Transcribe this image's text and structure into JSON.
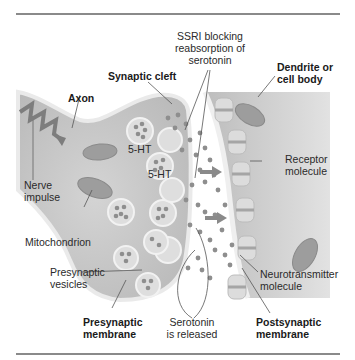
{
  "figure": {
    "labels": {
      "synaptic_cleft": "Synaptic cleft",
      "ssri": "SSRI blocking reabsorption of serotonin",
      "ssri_lines": [
        "SSRI blocking",
        "reabsorption of",
        "serotonin"
      ],
      "dendrite_lines": [
        "Dendrite or",
        "cell body"
      ],
      "axon": "Axon",
      "nerve_impulse_lines": [
        "Nerve",
        "impulse"
      ],
      "ht1": "5-HT",
      "ht2": "5-HT",
      "receptor_lines": [
        "Receptor",
        "molecule"
      ],
      "mitochondrion": "Mitochondrion",
      "presynaptic_vesicles_lines": [
        "Presynaptic",
        "vesicles"
      ],
      "neurotransmitter_lines": [
        "Neurotransmitter",
        "molecule"
      ],
      "presynaptic_membrane_lines": [
        "Presynaptic",
        "membrane"
      ],
      "serotonin_released_lines": [
        "Serotonin",
        "is released"
      ],
      "postsynaptic_membrane_lines": [
        "Postsynaptic",
        "membrane"
      ]
    },
    "colors": {
      "cell_fill": "#c9c9c9",
      "membrane": "#e6e6e6",
      "dots": "#8e8e8e",
      "arrow": "#7a7a7a",
      "rule": "#8a8a8a"
    }
  }
}
